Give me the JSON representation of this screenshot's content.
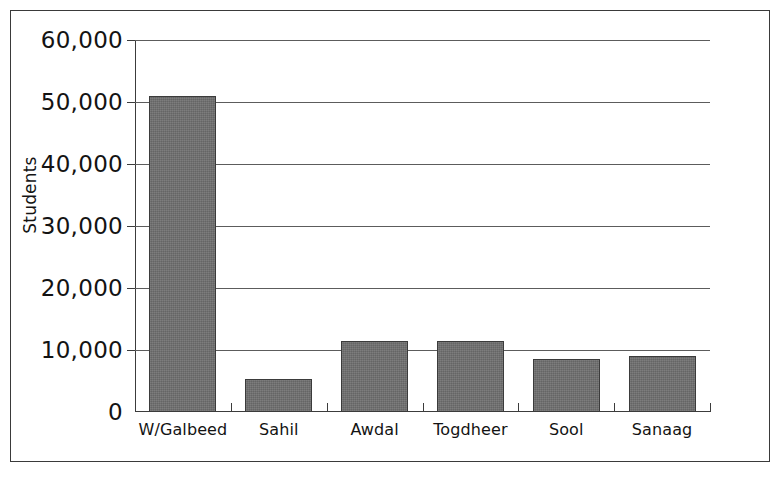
{
  "chart_data": {
    "type": "bar",
    "title": "",
    "xlabel": "",
    "ylabel": "Students",
    "categories": [
      "W/Galbeed",
      "Sahil",
      "Awdal",
      "Togdheer",
      "Sool",
      "Sanaag"
    ],
    "values": [
      51000,
      5300,
      11400,
      11400,
      8500,
      9000
    ],
    "ylim": [
      0,
      60000
    ],
    "ytick_values": [
      0,
      10000,
      20000,
      30000,
      40000,
      50000,
      60000
    ],
    "ytick_labels": [
      "0",
      "10,000",
      "20,000",
      "30,000",
      "40,000",
      "50,000",
      "60,000"
    ],
    "grid": true,
    "legend": false,
    "series": [
      {
        "name": "Students",
        "values": [
          51000,
          5300,
          11400,
          11400,
          8500,
          9000
        ]
      }
    ],
    "bar_color": "#6e6e6e",
    "bar_edge_color": "#3b3b3b",
    "gridline_color": "#5c5c5c",
    "axis_color": "#3c3c3c",
    "frame_color": "#3a3a3a",
    "background_color": "#ffffff"
  },
  "axis": {
    "y_title": "Students",
    "ticks": [
      {
        "label": "60,000",
        "value": 60000
      },
      {
        "label": "50,000",
        "value": 50000
      },
      {
        "label": "40,000",
        "value": 40000
      },
      {
        "label": "30,000",
        "value": 30000
      },
      {
        "label": "20,000",
        "value": 20000
      },
      {
        "label": "10,000",
        "value": 10000
      },
      {
        "label": "0",
        "value": 0
      }
    ]
  },
  "categories": [
    {
      "label": "W/Galbeed",
      "value": 51000
    },
    {
      "label": "Sahil",
      "value": 5300
    },
    {
      "label": "Awdal",
      "value": 11400
    },
    {
      "label": "Togdheer",
      "value": 11400
    },
    {
      "label": "Sool",
      "value": 8500
    },
    {
      "label": "Sanaag",
      "value": 9000
    }
  ]
}
